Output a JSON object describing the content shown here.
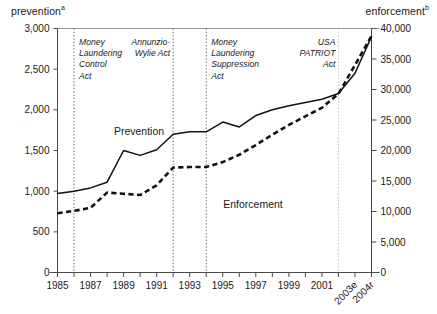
{
  "axis_titles": {
    "left": "prevention",
    "left_superscript": "a",
    "right": "enforcement",
    "right_superscript": "b"
  },
  "series_labels": {
    "prevention": "Prevention",
    "enforcement": "Enforcement"
  },
  "chart_data": {
    "type": "line",
    "title": "",
    "xlabel": "",
    "ylabel": "prevention",
    "y2label": "enforcement",
    "grid": false,
    "legend": "inline-annotations",
    "x": [
      1985,
      1986,
      1987,
      1988,
      1989,
      1990,
      1991,
      1992,
      1993,
      1994,
      1995,
      1996,
      1997,
      1998,
      1999,
      2000,
      2001,
      2002,
      2003,
      2004
    ],
    "x_tick_labels": [
      "1985",
      "",
      "1987",
      "",
      "1989",
      "",
      "1991",
      "",
      "1993",
      "",
      "1995",
      "",
      "1997",
      "",
      "1999",
      "",
      "2001",
      "",
      "2003e",
      "2004r"
    ],
    "ylim": [
      0,
      3000
    ],
    "y_ticks": [
      0,
      500,
      1000,
      1500,
      2000,
      2500,
      3000
    ],
    "y_tick_labels": [
      "0",
      "500",
      "1,000",
      "1,500",
      "2,000",
      "2,500",
      "3,000"
    ],
    "y2lim": [
      0,
      40000
    ],
    "y2_ticks": [
      0,
      5000,
      10000,
      15000,
      20000,
      25000,
      30000,
      35000,
      40000
    ],
    "y2_tick_labels": [
      "0",
      "5,000",
      "10,000",
      "15,000",
      "20,000",
      "25,000",
      "30,000",
      "35,000",
      "40,000"
    ],
    "series": [
      {
        "name": "Prevention",
        "axis": "left",
        "style": "solid",
        "values": [
          970,
          1000,
          1040,
          1110,
          1500,
          1440,
          1510,
          1700,
          1730,
          1730,
          1850,
          1790,
          1930,
          2000,
          2050,
          2090,
          2130,
          2200,
          2450,
          2900
        ]
      },
      {
        "name": "Enforcement",
        "axis": "right",
        "style": "dashed",
        "values": [
          9700,
          10100,
          10600,
          13100,
          12900,
          12700,
          14300,
          17200,
          17300,
          17300,
          18100,
          19300,
          20900,
          22600,
          24200,
          25600,
          27000,
          29300,
          34000,
          38800
        ]
      }
    ],
    "annotations": [
      {
        "label": "Money Laundering Control Act",
        "lines": [
          "Money",
          "Laundering",
          "Control",
          "Act"
        ],
        "year": 1986
      },
      {
        "label": "Annunzio-Wylie Act",
        "lines": [
          "Annunzio-",
          "Wylie Act"
        ],
        "year": 1992
      },
      {
        "label": "Money Laundering Suppression Act",
        "lines": [
          "Money",
          "Laundering",
          "Suppression",
          "Act"
        ],
        "year": 1994
      },
      {
        "label": "USA PATRIOT Act",
        "lines": [
          "USA",
          "PATRIOT",
          "Act"
        ],
        "year": 2002
      }
    ]
  }
}
